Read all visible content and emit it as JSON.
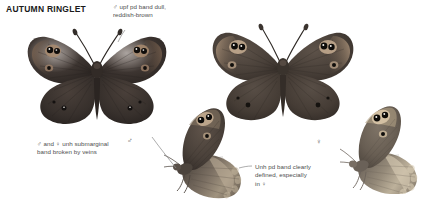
{
  "plate": {
    "title": "AUTUMN RINGLET",
    "background_color": "#ffffff",
    "text_color": "#4d4d4d",
    "title_color": "#1a1a1a",
    "leader_color": "#8a8a8a",
    "width": 436,
    "height": 199
  },
  "callouts": [
    {
      "id": "upf-band",
      "text": "♂ upf pd band dull,\nreddish-brown",
      "x": 113,
      "y": 3
    },
    {
      "id": "unh-submarginal",
      "text": "♂ and ♀ unh submarginal\nband broken by veins",
      "x": 37,
      "y": 140
    },
    {
      "id": "unh-pd-band",
      "text": "Unh pd band clearly\ndefined, especially\nin ♀",
      "x": 255,
      "y": 163
    }
  ],
  "sex_marks": [
    {
      "id": "male-underside",
      "symbol": "♂",
      "x": 127,
      "y": 137
    },
    {
      "id": "female-underside",
      "symbol": "♀",
      "x": 316,
      "y": 138
    }
  ],
  "specimens": [
    {
      "id": "male-upperside",
      "label": "♂ upperside",
      "view": "upperside",
      "sex": "male",
      "ground_color": "#3a3330",
      "band_color": "#6e5a4c",
      "ocellus_ring_color": "#c4a58c",
      "x": 24,
      "y": 22,
      "width": 146,
      "height": 108
    },
    {
      "id": "female-upperside",
      "label": "♀ upperside",
      "view": "upperside",
      "sex": "female",
      "ground_color": "#4a423c",
      "band_color": "#8a7460",
      "ocellus_ring_color": "#cdb49c",
      "x": 210,
      "y": 20,
      "width": 146,
      "height": 104
    },
    {
      "id": "male-underside",
      "label": "♂ underside",
      "view": "underside",
      "sex": "male",
      "ground_color": "#4a423c",
      "band_color": "#8b7c6c",
      "ocellus_ring_color": "#d0bba2",
      "x": 163,
      "y": 103,
      "width": 92,
      "height": 96
    },
    {
      "id": "female-underside",
      "label": "♀ underside",
      "view": "underside",
      "sex": "female",
      "ground_color": "#6b625a",
      "band_color": "#ab9d8c",
      "ocellus_ring_color": "#ddcab3",
      "x": 340,
      "y": 104,
      "width": 90,
      "height": 90
    }
  ]
}
